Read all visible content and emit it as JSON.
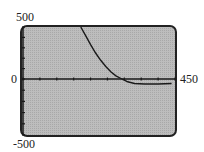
{
  "window": {
    "xmin_label": "0",
    "xmax_label": "450",
    "ymax_label": "500",
    "ymin_label": "-500"
  },
  "colors": {
    "screen_bg": "#b8b8b8",
    "frame": "#222222",
    "curve": "#1a1a1a",
    "axis": "#1a1a1a"
  },
  "chart_data": {
    "type": "line",
    "title": "",
    "xlabel": "",
    "ylabel": "",
    "xlim": [
      0,
      450
    ],
    "ylim": [
      -500,
      500
    ],
    "grid": false,
    "x_ticks": [
      0,
      50,
      100,
      150,
      200,
      250,
      300,
      350,
      400,
      450
    ],
    "y_ticks": [
      -500,
      -400,
      -300,
      -200,
      -100,
      0,
      100,
      200,
      300,
      400,
      500
    ],
    "tick_labels": {
      "x_right": "450",
      "y_top": "500",
      "y_center": "0",
      "y_bottom": "-500"
    },
    "series": [
      {
        "name": "decaying curve",
        "x": [
          171,
          185,
          200,
          215,
          230,
          245,
          260,
          275,
          290,
          300,
          310,
          330,
          360,
          400,
          440
        ],
        "y": [
          500,
          420,
          330,
          250,
          180,
          120,
          70,
          30,
          5,
          -10,
          -25,
          -40,
          -45,
          -45,
          -40
        ]
      }
    ]
  }
}
